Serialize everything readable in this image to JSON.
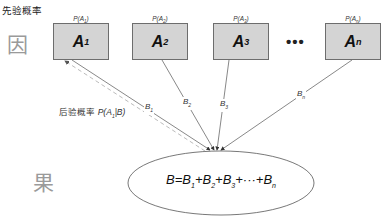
{
  "labels": {
    "prior_title": "先验概率",
    "cause": "因",
    "effect": "果",
    "posterior_prefix": "后验概率",
    "posterior_formula": "P(A",
    "posterior_sub": "1",
    "posterior_suffix": "|B)",
    "ellipsis": "•••"
  },
  "causes": [
    {
      "name": "A",
      "sub": "1",
      "prior": "P(A",
      "prior_sub": "1",
      "prior_close": ")",
      "edge": "B",
      "edge_sub": "1"
    },
    {
      "name": "A",
      "sub": "2",
      "prior": "P(A",
      "prior_sub": "2",
      "prior_close": ")",
      "edge": "B",
      "edge_sub": "2"
    },
    {
      "name": "A",
      "sub": "3",
      "prior": "P(A",
      "prior_sub": "3",
      "prior_close": ")",
      "edge": "B",
      "edge_sub": "3"
    },
    {
      "name": "A",
      "sub": "n",
      "prior": "P(A",
      "prior_sub": "n",
      "prior_close": ")",
      "edge": "B",
      "edge_sub": "n"
    }
  ],
  "effect_formula": {
    "lhs": "B=B",
    "t1_sub": "1",
    "t2": "+B",
    "t2_sub": "2",
    "t3": "+B",
    "t3_sub": "3",
    "dots": "+···+B",
    "tn_sub": "n"
  },
  "colors": {
    "box_fill": "#d4d4d4",
    "box_border": "#6d6d6d",
    "line": "#555555",
    "dashed": "#aaaaaa",
    "cause_effect_text": "#9a9a9a"
  }
}
